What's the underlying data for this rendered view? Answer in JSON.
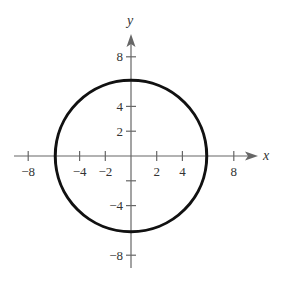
{
  "chart_data": {
    "type": "line",
    "title": "",
    "xlabel": "x",
    "ylabel": "y",
    "xlim": [
      -8,
      8
    ],
    "ylim": [
      -8,
      8
    ],
    "grid": false,
    "x_ticks": [
      -8,
      -4,
      -2,
      2,
      4,
      8
    ],
    "x_tick_labels": [
      "−8",
      "−4",
      "−2",
      "2",
      "4",
      "8"
    ],
    "y_ticks": [
      8,
      4,
      2,
      -2,
      -4,
      -8
    ],
    "y_tick_labels": [
      "8",
      "4",
      "2",
      "",
      "−4",
      "−8"
    ],
    "series": [
      {
        "name": "circle x^2 + y^2 = 36",
        "shape": "circle",
        "center": [
          0,
          0
        ],
        "radius": 6
      }
    ]
  },
  "axes": {
    "x_label": "x",
    "y_label": "y"
  },
  "colors": {
    "curve": "#111111",
    "axis": "#666666"
  }
}
